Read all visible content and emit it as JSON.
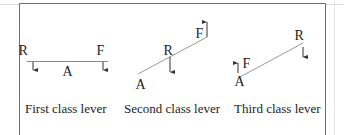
{
  "colors": {
    "frame": "#6e6e6e",
    "faint": "#d8d8d8",
    "lever": "#9a9a9a",
    "arrow": "#333333",
    "text": "#222222"
  },
  "levers": [
    {
      "caption": "First class lever",
      "labels": {
        "effort": "F",
        "resistance": "R",
        "fulcrum": "A"
      },
      "order": "R - A - F (fulcrum between load and effort)",
      "effort_direction": "down",
      "resistance_direction": "down"
    },
    {
      "caption": "Second class lever",
      "labels": {
        "effort": "F",
        "resistance": "R",
        "fulcrum": "A"
      },
      "order": "A - R - F (load between fulcrum and effort)",
      "effort_direction": "up",
      "resistance_direction": "down"
    },
    {
      "caption": "Third class lever",
      "labels": {
        "effort": "F",
        "resistance": "R",
        "fulcrum": "A"
      },
      "order": "A - F - R (effort between fulcrum and load)",
      "effort_direction": "up",
      "resistance_direction": "down"
    }
  ]
}
